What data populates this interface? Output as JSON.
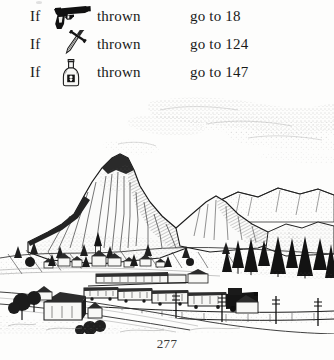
{
  "page": {
    "folio": "277",
    "background_color": "#fdfdfc",
    "ink_color": "#181818"
  },
  "choices": {
    "rows": [
      {
        "condition": "If",
        "icon": "pistol-icon",
        "icon_label": "pistol",
        "verb": "thrown",
        "destination": "go to 18",
        "section_number": "18"
      },
      {
        "condition": "If",
        "icon": "dagger-icon",
        "icon_label": "dagger",
        "verb": "thrown",
        "destination": "go to 124",
        "section_number": "124"
      },
      {
        "condition": "If",
        "icon": "poison-bottle-icon",
        "icon_label": "poison bottle",
        "verb": "thrown",
        "destination": "go to 147",
        "section_number": "147"
      }
    ]
  },
  "illustration": {
    "name": "mountain-valley-railway-illustration",
    "style": "pen-and-ink stipple line drawing",
    "elements": [
      "stippled clouds",
      "main rocky peak",
      "secondary ridges",
      "alpine village with church steeple",
      "railway train with locomotive and carriages",
      "railway track in foreground",
      "conifer trees",
      "barns and farmhouses",
      "telegraph poles",
      "meadow and road"
    ]
  }
}
